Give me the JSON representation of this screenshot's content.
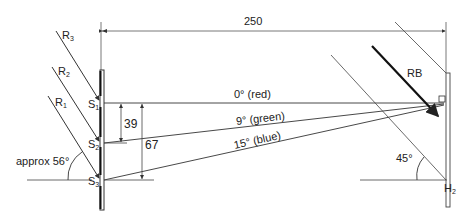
{
  "diagram": {
    "colors": {
      "line": "#333333",
      "thin_line": "#555555",
      "background": "#ffffff"
    },
    "dimensions": {
      "horizontal_distance": "250",
      "s1_s2_spacing": "39",
      "s1_s3_spacing": "67"
    },
    "slits": {
      "s1": "S",
      "s1_sub": "1",
      "s2": "S",
      "s2_sub": "2",
      "s3": "S",
      "s3_sub": "3"
    },
    "rays_in": {
      "r1": "R",
      "r1_sub": "1",
      "r2": "R",
      "r2_sub": "2",
      "r3": "R",
      "r3_sub": "3"
    },
    "beams": {
      "red": "0° (red)",
      "green": "9° (green)",
      "blue": "15° (blue)"
    },
    "angles": {
      "incident": "approx 56°",
      "hologram": "45°"
    },
    "reference_beam": "RB",
    "hologram_plate": {
      "label": "H",
      "sub": "2"
    }
  }
}
